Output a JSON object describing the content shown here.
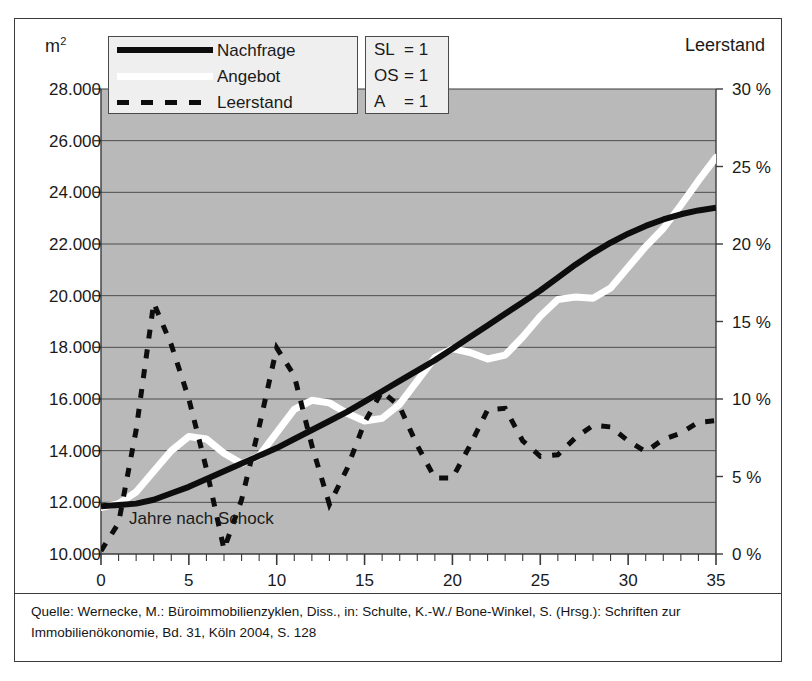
{
  "figure": {
    "left_axis_unit": "m",
    "left_axis_unit_sup": "2",
    "right_axis_title": "Leerstand",
    "annotation": "Jahre nach Schock",
    "caption_line1": "Quelle: Wernecke, M.: Büroimmobilienzyklen, Diss., in: Schulte, K.-W./ Bone-Winkel, S. (Hrsg.): Schriften zur",
    "caption_line2": "Immobilienökonomie, Bd. 31, Köln 2004, S. 128"
  },
  "legend": {
    "series": [
      {
        "label": "Nachfrage",
        "style": "solid-black",
        "color": "#0d0d0d"
      },
      {
        "label": "Angebot",
        "style": "solid-white",
        "color": "#ffffff"
      },
      {
        "label": "Leerstand",
        "style": "dashed-black",
        "color": "#0d0d0d"
      }
    ],
    "parameters": [
      {
        "key": "SL",
        "value": "= 1"
      },
      {
        "key": "OS",
        "value": "= 1"
      },
      {
        "key": "A",
        "value": "= 1"
      }
    ]
  },
  "colors": {
    "plot_background": "#b9b9b9",
    "gridline": "#4d4d4d",
    "axis": "#3b3b3b",
    "demand": "#0d0d0d",
    "supply": "#ffffff",
    "vacancy": "#0d0d0d",
    "frame": "#3b3b3b",
    "legend_background": "#efefef"
  },
  "chart_data": {
    "type": "line",
    "title": "",
    "subtitle": "",
    "xlabel": "Jahre nach Schock",
    "ylabel": "m²",
    "y2label": "Leerstand",
    "xlim": [
      0,
      35
    ],
    "ylim": [
      10000,
      28000
    ],
    "y2lim": [
      0,
      30
    ],
    "grid": true,
    "legend_position": "top-left-inside",
    "xticks": [
      0,
      5,
      10,
      15,
      20,
      25,
      30,
      35
    ],
    "xtick_labels": [
      "0",
      "5",
      "10",
      "15",
      "20",
      "25",
      "30",
      "35"
    ],
    "x_minor_tick_step": 1,
    "yticks_left": [
      10000,
      12000,
      14000,
      16000,
      18000,
      20000,
      22000,
      24000,
      26000,
      28000
    ],
    "ytick_labels_left": [
      "10.000",
      "12.000",
      "14.000",
      "16.000",
      "18.000",
      "20.000",
      "22.000",
      "24.000",
      "26.000",
      "28.000"
    ],
    "yticks_right": [
      0,
      5,
      10,
      15,
      20,
      25,
      30
    ],
    "ytick_labels_right": [
      "0 %",
      "5 %",
      "10 %",
      "15 %",
      "20 %",
      "25 %",
      "30 %"
    ],
    "x": [
      0,
      1,
      2,
      3,
      4,
      5,
      6,
      7,
      8,
      9,
      10,
      11,
      12,
      13,
      14,
      15,
      16,
      17,
      18,
      19,
      20,
      21,
      22,
      23,
      24,
      25,
      26,
      27,
      28,
      29,
      30,
      31,
      32,
      33,
      34,
      35
    ],
    "series": [
      {
        "name": "Nachfrage",
        "axis": "left",
        "unit": "m²",
        "values": [
          11850,
          11900,
          11950,
          12100,
          12350,
          12600,
          12900,
          13200,
          13500,
          13800,
          14100,
          14450,
          14800,
          15150,
          15500,
          15900,
          16300,
          16700,
          17100,
          17500,
          17950,
          18400,
          18850,
          19300,
          19750,
          20200,
          20700,
          21200,
          21650,
          22050,
          22400,
          22700,
          22950,
          23150,
          23300,
          23400
        ]
      },
      {
        "name": "Angebot",
        "axis": "left",
        "unit": "m²",
        "values": [
          11800,
          11950,
          12400,
          13200,
          14000,
          14550,
          14450,
          13900,
          13500,
          13800,
          14700,
          15600,
          15950,
          15850,
          15450,
          15150,
          15250,
          15800,
          16700,
          17600,
          17950,
          17800,
          17550,
          17700,
          18400,
          19200,
          19850,
          19950,
          19900,
          20300,
          21100,
          21900,
          22600,
          23500,
          24450,
          25350
        ]
      },
      {
        "name": "Leerstand",
        "axis": "right",
        "unit": "%",
        "values": [
          0.2,
          2.0,
          8.0,
          16.2,
          13.5,
          10.0,
          5.5,
          0.3,
          3.5,
          8.2,
          13.3,
          11.5,
          7.0,
          3.2,
          5.5,
          8.5,
          10.5,
          9.5,
          7.0,
          4.9,
          4.9,
          7.0,
          9.3,
          9.4,
          7.3,
          6.3,
          6.4,
          7.5,
          8.3,
          8.2,
          7.3,
          6.6,
          7.4,
          7.8,
          8.5,
          8.6
        ]
      }
    ]
  }
}
